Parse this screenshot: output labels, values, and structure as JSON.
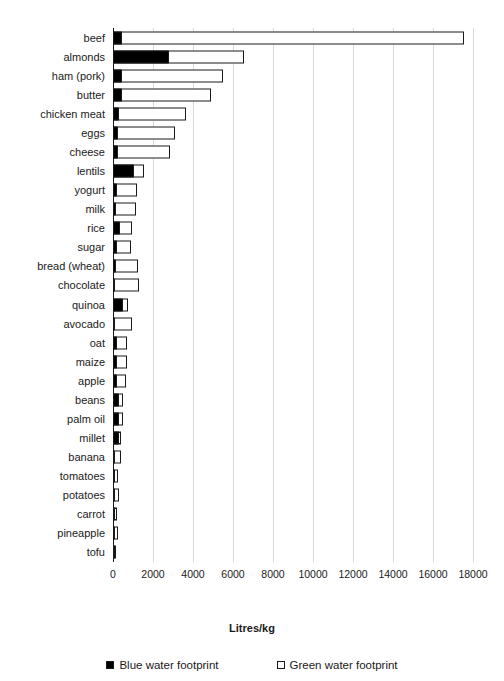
{
  "chart_data": {
    "type": "bar",
    "orientation": "horizontal",
    "stacked": true,
    "title": "",
    "xlabel": "Litres/kg",
    "ylabel": "",
    "xlim": [
      0,
      19000
    ],
    "xticks": [
      0,
      2000,
      4000,
      6000,
      8000,
      10000,
      12000,
      14000,
      16000,
      18000
    ],
    "xtick_labels": [
      "0",
      "2000",
      "4000",
      "6000",
      "8000",
      "10000",
      "12000",
      "14000",
      "16000",
      "18000"
    ],
    "grid": "vertical",
    "legend_position": "bottom",
    "categories": [
      "beef",
      "almonds",
      "ham (pork)",
      "butter",
      "chicken meat",
      "eggs",
      "cheese",
      "lentils",
      "yogurt",
      "milk",
      "rice",
      "sugar",
      "bread (wheat)",
      "chocolate",
      "quinoa",
      "avocado",
      "oat",
      "maize",
      "apple",
      "beans",
      "palm oil",
      "millet",
      "banana",
      "tomatoes",
      "potatoes",
      "carrot",
      "pineapple",
      "tofu"
    ],
    "series": [
      {
        "name": "Blue water footprint",
        "color": "#000000",
        "values": [
          450,
          2800,
          460,
          460,
          300,
          240,
          250,
          1050,
          180,
          170,
          340,
          200,
          140,
          120,
          480,
          80,
          180,
          200,
          180,
          300,
          290,
          280,
          90,
          60,
          60,
          30,
          30,
          40
        ]
      },
      {
        "name": "Green water footprint",
        "color": "#ffffff",
        "values": [
          17150,
          3800,
          5080,
          4490,
          3400,
          2910,
          2650,
          550,
          1060,
          1030,
          670,
          760,
          1150,
          1220,
          330,
          880,
          570,
          530,
          520,
          250,
          250,
          170,
          370,
          190,
          230,
          160,
          180,
          80
        ]
      }
    ],
    "totals": [
      17600,
      6600,
      5540,
      4950,
      3700,
      3150,
      2900,
      1600,
      1240,
      1200,
      1010,
      960,
      1290,
      1340,
      810,
      960,
      750,
      730,
      700,
      550,
      540,
      450,
      460,
      250,
      290,
      190,
      210,
      120
    ]
  },
  "legend": {
    "items": [
      {
        "label": "Blue water footprint",
        "swatch": "filled-square"
      },
      {
        "label": "Green water footprint",
        "swatch": "empty-square"
      }
    ]
  }
}
